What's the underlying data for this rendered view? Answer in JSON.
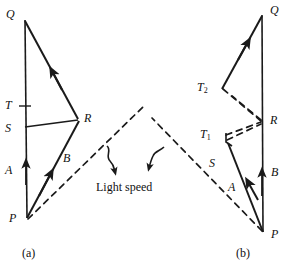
{
  "figure": {
    "title_annotation": "Light speed",
    "captions": [
      {
        "id": "caption-a",
        "text": "(a)",
        "x": 22,
        "y": 246
      },
      {
        "id": "caption-b",
        "text": "(b)",
        "x": 236,
        "y": 246
      }
    ],
    "panels": [
      {
        "id": "panel-a",
        "caption": "(a)",
        "points": [
          {
            "name": "Q",
            "label": "Q",
            "x": 24,
            "y": 20,
            "label_x": 6,
            "label_y": 8
          },
          {
            "name": "T",
            "label": "T",
            "x": 24,
            "y": 106,
            "label_x": 5,
            "label_y": 99
          },
          {
            "name": "S",
            "label": "S",
            "x": 24,
            "y": 128,
            "label_x": 5,
            "label_y": 122
          },
          {
            "name": "R",
            "label": "R",
            "x": 78,
            "y": 119,
            "label_x": 84,
            "label_y": 112
          },
          {
            "name": "A",
            "label": "A",
            "x": 24,
            "y": 170,
            "label_x": 5,
            "label_y": 164
          },
          {
            "name": "B",
            "label": "B",
            "x": 52,
            "y": 160,
            "label_x": 63,
            "label_y": 152
          },
          {
            "name": "P",
            "label": "P",
            "x": 27,
            "y": 218,
            "label_x": 9,
            "label_y": 212
          }
        ]
      },
      {
        "id": "panel-b",
        "caption": "(b)",
        "points": [
          {
            "name": "Q",
            "label": "Q",
            "x": 263,
            "y": 15,
            "label_x": 270,
            "label_y": 4
          },
          {
            "name": "T2",
            "label": "T",
            "sub": "2",
            "x": 222,
            "y": 88,
            "label_x": 197,
            "label_y": 81
          },
          {
            "name": "T1",
            "label": "T",
            "sub": "1",
            "x": 225,
            "y": 136,
            "label_x": 200,
            "label_y": 128
          },
          {
            "name": "R",
            "label": "R",
            "x": 262,
            "y": 122,
            "label_x": 270,
            "label_y": 114
          },
          {
            "name": "S",
            "label": "S",
            "x": 240,
            "y": 166,
            "label_x": 209,
            "label_y": 157
          },
          {
            "name": "A",
            "label": "A",
            "x": 250,
            "y": 190,
            "label_x": 228,
            "label_y": 181
          },
          {
            "name": "B",
            "label": "B",
            "x": 263,
            "y": 176,
            "label_x": 271,
            "label_y": 166
          },
          {
            "name": "P",
            "label": "P",
            "x": 263,
            "y": 232,
            "label_x": 271,
            "label_y": 228
          }
        ]
      }
    ],
    "annotation": {
      "text": "Light speed",
      "x": 96,
      "y": 180
    },
    "colors": {
      "ink": "#1a1a1a",
      "background": "#ffffff"
    }
  }
}
